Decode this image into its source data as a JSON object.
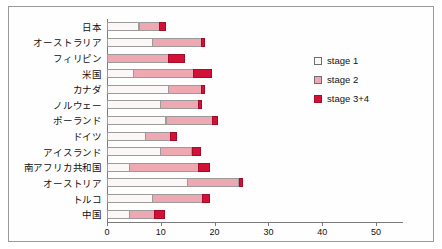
{
  "chart_data": {
    "type": "bar",
    "orientation": "horizontal",
    "stacked": true,
    "title": "",
    "xlabel": "",
    "ylabel": "",
    "xlim": [
      0,
      55
    ],
    "xticks": [
      0,
      10,
      20,
      30,
      40,
      50
    ],
    "xtick_labels": [
      "0",
      "10",
      "20",
      "30",
      "40",
      "50"
    ],
    "grid": false,
    "legend_position": "right",
    "categories": [
      "日本",
      "オーストラリア",
      "フィリピン",
      "米国",
      "カナダ",
      "ノルウェー",
      "ポーランド",
      "ドイツ",
      "アイスランド",
      "南アフリカ共和国",
      "オーストリア",
      "トルコ",
      "中国"
    ],
    "series": [
      {
        "name": "stage 1",
        "color": "#fbf7f7",
        "values": [
          6.0,
          8.5,
          0.0,
          5.0,
          11.5,
          10.0,
          11.0,
          7.2,
          10.0,
          4.3,
          15.0,
          8.5,
          4.3
        ]
      },
      {
        "name": "stage 2",
        "color": "#eda8b2",
        "values": [
          4.0,
          9.2,
          11.5,
          11.3,
          6.2,
          7.2,
          8.8,
          4.8,
          6.0,
          12.9,
          9.7,
          9.5,
          4.7
        ]
      },
      {
        "name": "stage 3+4",
        "color": "#d31036",
        "values": [
          1.2,
          0.7,
          3.1,
          3.5,
          0.7,
          0.8,
          1.0,
          1.2,
          1.7,
          2.2,
          0.8,
          1.4,
          2.0
        ]
      }
    ],
    "totals": [
      11.2,
      18.4,
      14.6,
      19.8,
      18.4,
      18.0,
      20.8,
      13.2,
      17.7,
      19.4,
      25.5,
      19.4,
      11.0
    ]
  },
  "legend": {
    "items": [
      {
        "label": "stage 1"
      },
      {
        "label": "stage 2"
      },
      {
        "label": "stage 3+4"
      }
    ]
  }
}
